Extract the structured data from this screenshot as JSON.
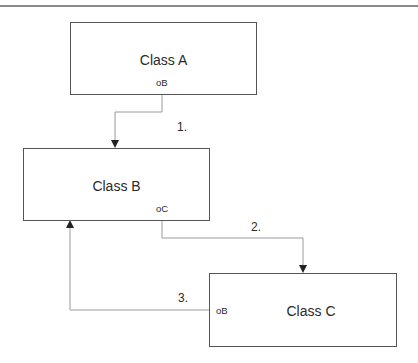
{
  "diagram": {
    "title": "",
    "classes": [
      {
        "id": "A",
        "label": "Class A",
        "port": "oB"
      },
      {
        "id": "B",
        "label": "Class B",
        "port": "oC"
      },
      {
        "id": "C",
        "label": "Class C",
        "port": "oB"
      }
    ],
    "connectors": [
      {
        "from": "Class A.oB",
        "to": "Class B",
        "label": "1."
      },
      {
        "from": "Class B.oC",
        "to": "Class C",
        "label": "2."
      },
      {
        "from": "Class C.oB",
        "to": "Class B",
        "label": "3."
      }
    ],
    "colors": {
      "box_border": "#555555",
      "wire": "#9a9a9a",
      "arrow": "#222222",
      "top_rule": "#8a8a8a"
    }
  }
}
